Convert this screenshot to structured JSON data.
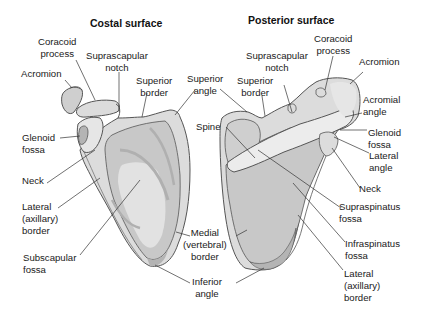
{
  "titles": {
    "left": "Costal surface",
    "right": "Posterior surface"
  },
  "colors": {
    "bone_fill": "#dcdcdc",
    "bone_light": "#ececec",
    "fossa_fill": "#c8c8c8",
    "shadow_fill": "#b4b4b4",
    "outline": "#555555",
    "leader": "#333333",
    "text": "#1a1a1a"
  },
  "left_labels": {
    "coracoid_process": "Coracoid\nprocess",
    "suprascapular_notch": "Suprascapular\nnotch",
    "acromion": "Acromion",
    "superior_border": "Superior\nborder",
    "glenoid_fossa": "Glenoid\nfossa",
    "neck": "Neck",
    "lateral_border": "Lateral\n(axillary)\nborder",
    "subscapular_fossa": "Subscapular\nfossa"
  },
  "center_labels": {
    "superior_angle": "Superior\nangle",
    "spine": "Spine",
    "medial_border": "Medial\n(vertebral)\nborder",
    "inferior_angle": "Inferior\nangle"
  },
  "right_labels": {
    "suprascapular_notch": "Suprascapular\nnotch",
    "coracoid_process": "Coracoid\nprocess",
    "superior_border": "Superior\nborder",
    "acromion": "Acromion",
    "acromial_angle": "Acromial\nangle",
    "glenoid_fossa": "Glenoid\nfossa",
    "lateral_angle": "Lateral\nangle",
    "neck": "Neck",
    "supraspinatus_fossa": "Supraspinatus\nfossa",
    "infraspinatus_fossa": "Infraspinatus\nfossa",
    "lateral_border": "Lateral\n(axillary)\nborder"
  }
}
